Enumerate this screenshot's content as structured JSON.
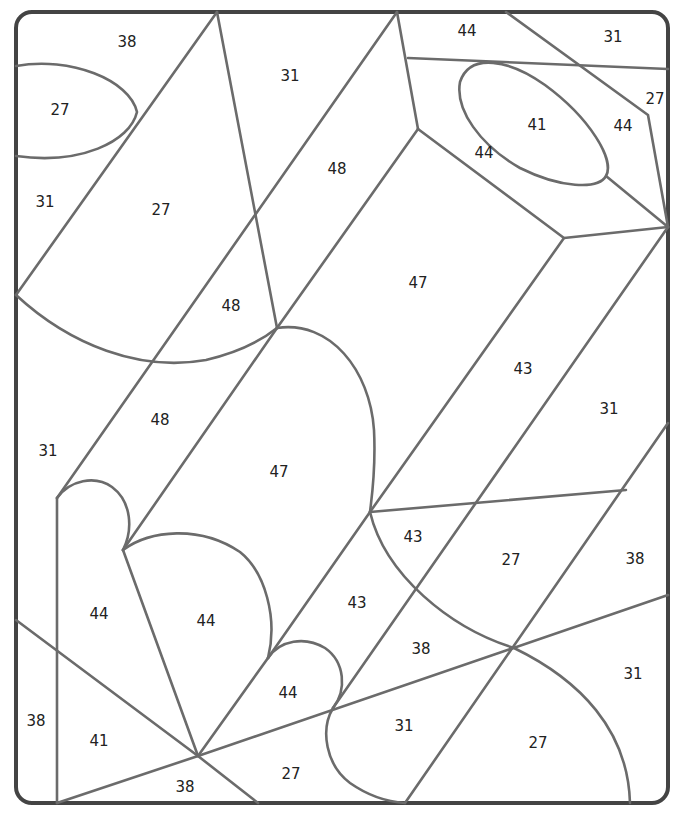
{
  "worksheet": {
    "type": "color-by-number",
    "line_color": "#6b6b6b",
    "frame_color": "#444444",
    "regions": [
      {
        "id": "r1",
        "label": "38",
        "x": 127,
        "y": 42
      },
      {
        "id": "r2",
        "label": "27",
        "x": 60,
        "y": 110
      },
      {
        "id": "r3",
        "label": "31",
        "x": 290,
        "y": 76
      },
      {
        "id": "r4",
        "label": "44",
        "x": 467,
        "y": 31
      },
      {
        "id": "r5",
        "label": "31",
        "x": 613,
        "y": 37
      },
      {
        "id": "r6",
        "label": "27",
        "x": 655,
        "y": 99
      },
      {
        "id": "r7",
        "label": "41",
        "x": 537,
        "y": 125
      },
      {
        "id": "r8",
        "label": "44",
        "x": 623,
        "y": 126
      },
      {
        "id": "r9",
        "label": "44",
        "x": 484,
        "y": 153
      },
      {
        "id": "r10",
        "label": "31",
        "x": 45,
        "y": 202
      },
      {
        "id": "r11",
        "label": "27",
        "x": 161,
        "y": 210
      },
      {
        "id": "r12",
        "label": "48",
        "x": 337,
        "y": 169
      },
      {
        "id": "r13",
        "label": "47",
        "x": 418,
        "y": 283
      },
      {
        "id": "r14",
        "label": "48",
        "x": 231,
        "y": 306
      },
      {
        "id": "r15",
        "label": "43",
        "x": 523,
        "y": 369
      },
      {
        "id": "r16",
        "label": "31",
        "x": 609,
        "y": 409
      },
      {
        "id": "r17",
        "label": "48",
        "x": 160,
        "y": 420
      },
      {
        "id": "r18",
        "label": "31",
        "x": 48,
        "y": 451
      },
      {
        "id": "r19",
        "label": "47",
        "x": 279,
        "y": 472
      },
      {
        "id": "r20",
        "label": "43",
        "x": 413,
        "y": 537
      },
      {
        "id": "r21",
        "label": "27",
        "x": 511,
        "y": 560
      },
      {
        "id": "r22",
        "label": "38",
        "x": 635,
        "y": 559
      },
      {
        "id": "r23",
        "label": "43",
        "x": 357,
        "y": 603
      },
      {
        "id": "r24",
        "label": "44",
        "x": 99,
        "y": 614
      },
      {
        "id": "r25",
        "label": "44",
        "x": 206,
        "y": 621
      },
      {
        "id": "r26",
        "label": "38",
        "x": 421,
        "y": 649
      },
      {
        "id": "r27",
        "label": "31",
        "x": 633,
        "y": 674
      },
      {
        "id": "r28",
        "label": "44",
        "x": 288,
        "y": 693
      },
      {
        "id": "r29",
        "label": "38",
        "x": 36,
        "y": 721
      },
      {
        "id": "r30",
        "label": "41",
        "x": 99,
        "y": 741
      },
      {
        "id": "r31",
        "label": "31",
        "x": 404,
        "y": 726
      },
      {
        "id": "r32",
        "label": "27",
        "x": 538,
        "y": 743
      },
      {
        "id": "r33",
        "label": "27",
        "x": 291,
        "y": 774
      },
      {
        "id": "r34",
        "label": "38",
        "x": 185,
        "y": 787
      }
    ]
  }
}
